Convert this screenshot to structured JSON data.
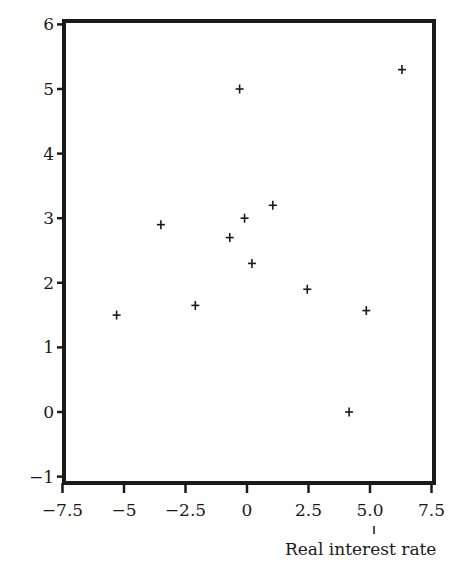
{
  "chart_data": {
    "type": "scatter",
    "title": "",
    "xlabel": "Real interest rate",
    "ylabel": "",
    "xlim": [
      -7.5,
      7.5
    ],
    "ylim": [
      -1,
      6
    ],
    "grid": false,
    "legend": null,
    "marker": "+",
    "x_ticks": [
      -7.5,
      -5,
      -2.5,
      0,
      2.5,
      5.0,
      7.5
    ],
    "x_tick_labels": [
      "−7.5",
      "−5",
      "−2.5",
      "0",
      "2.5",
      "5.0",
      "7.5"
    ],
    "y_ticks": [
      6,
      5,
      4,
      3,
      2,
      1,
      0,
      -1
    ],
    "y_tick_labels": [
      "6",
      "5",
      "4",
      "3",
      "2",
      "1",
      "0",
      "−1"
    ],
    "series": [
      {
        "name": "observations",
        "points": [
          {
            "x": -5.3,
            "y": 1.5
          },
          {
            "x": -3.5,
            "y": 2.9
          },
          {
            "x": -2.1,
            "y": 1.65
          },
          {
            "x": -0.7,
            "y": 2.7
          },
          {
            "x": -0.3,
            "y": 5.0
          },
          {
            "x": -0.1,
            "y": 3.0
          },
          {
            "x": 0.2,
            "y": 2.3
          },
          {
            "x": 1.05,
            "y": 3.2
          },
          {
            "x": 2.45,
            "y": 1.9
          },
          {
            "x": 4.15,
            "y": 0.0
          },
          {
            "x": 4.85,
            "y": 1.57
          },
          {
            "x": 6.3,
            "y": 5.3
          }
        ]
      }
    ]
  },
  "colors": {
    "ink": "#1a1a1a",
    "background": "#ffffff"
  }
}
